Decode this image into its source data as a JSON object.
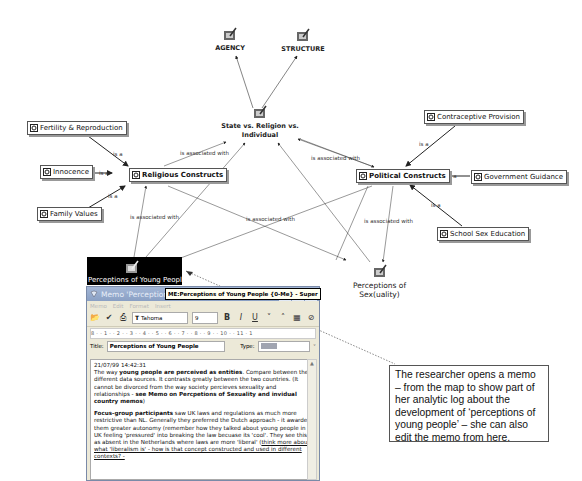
{
  "map": {
    "memo_nodes": [
      {
        "id": "agency",
        "label": "AGENCY"
      },
      {
        "id": "structure",
        "label": "STRUCTURE"
      },
      {
        "id": "state",
        "label_line1": "State vs. Religion vs.",
        "label_line2": "Individual"
      },
      {
        "id": "sexuality",
        "label": "Perceptions of Sex(uality)"
      },
      {
        "id": "young_people",
        "label": "Perceptions of Young People"
      }
    ],
    "code_nodes": [
      {
        "id": "fertility",
        "label": "Fertility & Reproduction"
      },
      {
        "id": "innocence",
        "label": "Innocence"
      },
      {
        "id": "family",
        "label": "Family Values"
      },
      {
        "id": "religious",
        "label": "Religious Constructs"
      },
      {
        "id": "political",
        "label": "Political Constructs"
      },
      {
        "id": "contraceptive",
        "label": "Contraceptive Provision"
      },
      {
        "id": "government",
        "label": "Government Guidance"
      },
      {
        "id": "school",
        "label": "School Sex Education"
      }
    ],
    "link_labels": {
      "is_a": "is a",
      "assoc": "is associated with"
    }
  },
  "memo_window": {
    "title": "Memo 'Perceptions of",
    "tooltip": "ME:Perceptions of Young People {0-Me} - Super",
    "menu": [
      "Memo",
      "Edit",
      "Format",
      "Insert"
    ],
    "font": "Tahoma",
    "size": "9",
    "ruler": "8 · · 1 · · 2 · · 3 · · 4 · · 5 · · 6 · · 7 · · 8 · · 9 · · 10 · · 11 · 1",
    "title_label": "Title:",
    "title_value": "Perceptions of Young People",
    "type_label": "Type:",
    "body": {
      "timestamp": "21/07/99 14:42:31",
      "p1_a": "The way ",
      "p1_b": "young people are perceived as entities",
      "p1_c": ". Compare between the different data sources. It contrasts greatly between the two countries. (It cannot be divorced from the way society percieves sexuality and relationships - ",
      "p1_d": "see Memo on Percpetions of Sexuality and invidual country memos",
      "p1_e": ")",
      "p2_a": "Focus-group participants",
      "p2_b": " saw UK laws and regulations as much more restrictive than NL. Generally they preferred the Dutch approach - it awarded them greater autonomy (remember how they talked about young people in UK feeling 'pressured' into breaking the law becuase its 'cool'. They see this as absent in the Netherlands where laws are more 'liberal' (",
      "p2_c": "think more about what 'liberalism is' - how is that concept constructed and used in different contexts? -"
    }
  },
  "callout": {
    "text": "The researcher opens a memo – from the map to show part of her analytic log about the development of ‘perceptions of young people’ – she can also edit the memo from here."
  },
  "colors": {
    "titlebar": "#8aa0c4",
    "window_bg": "#ece9d8",
    "selected_node_bg": "#000000"
  }
}
